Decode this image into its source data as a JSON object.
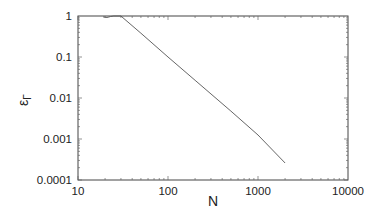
{
  "chart_data": {
    "type": "line",
    "title": "",
    "xlabel": "N",
    "ylabel": "ε_Γ",
    "xscale": "log",
    "yscale": "log",
    "xlim": [
      10,
      10000
    ],
    "ylim": [
      0.0001,
      1
    ],
    "x_ticks": [
      "10",
      "100",
      "1000",
      "10000"
    ],
    "y_ticks": [
      "1",
      "0.1",
      "0.01",
      "0.001",
      "0.0001"
    ],
    "grid": false,
    "legend": null,
    "series": [
      {
        "name": "epsilon_gamma",
        "color": "#555555",
        "x": [
          19,
          21,
          23,
          25,
          30,
          50,
          100,
          200,
          500,
          1000,
          2000
        ],
        "y": [
          0.95,
          0.92,
          0.97,
          1.0,
          1.0,
          0.38,
          0.1,
          0.027,
          0.0048,
          0.00125,
          0.00026
        ]
      }
    ]
  }
}
